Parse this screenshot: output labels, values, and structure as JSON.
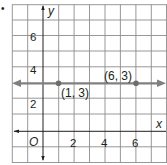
{
  "problem_marker": "•",
  "axes": {
    "x_label": "x",
    "y_label": "y",
    "origin_label": "O",
    "x_ticks": [
      "2",
      "4",
      "6"
    ],
    "y_ticks": [
      "2",
      "4",
      "6"
    ]
  },
  "line": {
    "description": "horizontal line y = 3",
    "color": "#808080"
  },
  "points": [
    {
      "label": "(1, 3)",
      "x": 1,
      "y": 3
    },
    {
      "label": "(6, 3)",
      "x": 6,
      "y": 3
    }
  ],
  "colors": {
    "grid": "#8c8c8c",
    "axis": "#231f20",
    "line": "#808080",
    "point": "#6d6d6d"
  }
}
